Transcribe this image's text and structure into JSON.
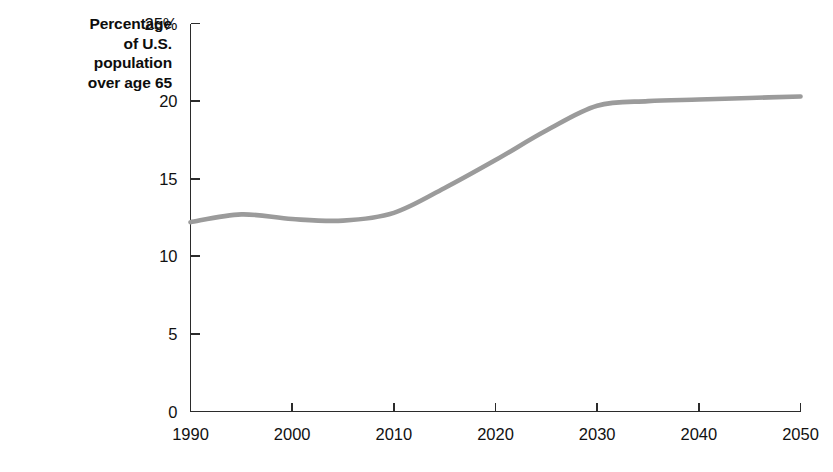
{
  "chart_data": {
    "type": "line",
    "title": "",
    "axis_title_lines": [
      "Percentage",
      "of U.S.",
      "population",
      "over age 65"
    ],
    "xlabel": "",
    "ylabel": "Percentage of U.S. population over age 65",
    "xlim": [
      1990,
      2050
    ],
    "ylim": [
      0,
      25
    ],
    "xticks": [
      1990,
      2000,
      2010,
      2020,
      2030,
      2040,
      2050
    ],
    "xtick_labels": [
      "1990",
      "2000",
      "2010",
      "2020",
      "2030",
      "2040",
      "2050"
    ],
    "yticks": [
      0,
      5,
      10,
      15,
      20,
      25
    ],
    "ytick_labels": [
      "0",
      "5",
      "10",
      "15",
      "20",
      "25%"
    ],
    "grid": false,
    "legend": false,
    "legend_position": "none",
    "line_color": "#9b9b9b",
    "line_width": 4.6,
    "axis_color": "#2b2b2b",
    "text_color": "#111111",
    "background": "#ffffff",
    "series": [
      {
        "name": "Percentage of U.S. population over age 65",
        "x": [
          1990,
          1995,
          2000,
          2005,
          2010,
          2015,
          2020,
          2025,
          2030,
          2035,
          2040,
          2045,
          2050
        ],
        "values": [
          12.2,
          12.7,
          12.4,
          12.3,
          12.8,
          14.4,
          16.2,
          18.1,
          19.7,
          20.0,
          20.1,
          20.2,
          20.3
        ]
      }
    ]
  }
}
